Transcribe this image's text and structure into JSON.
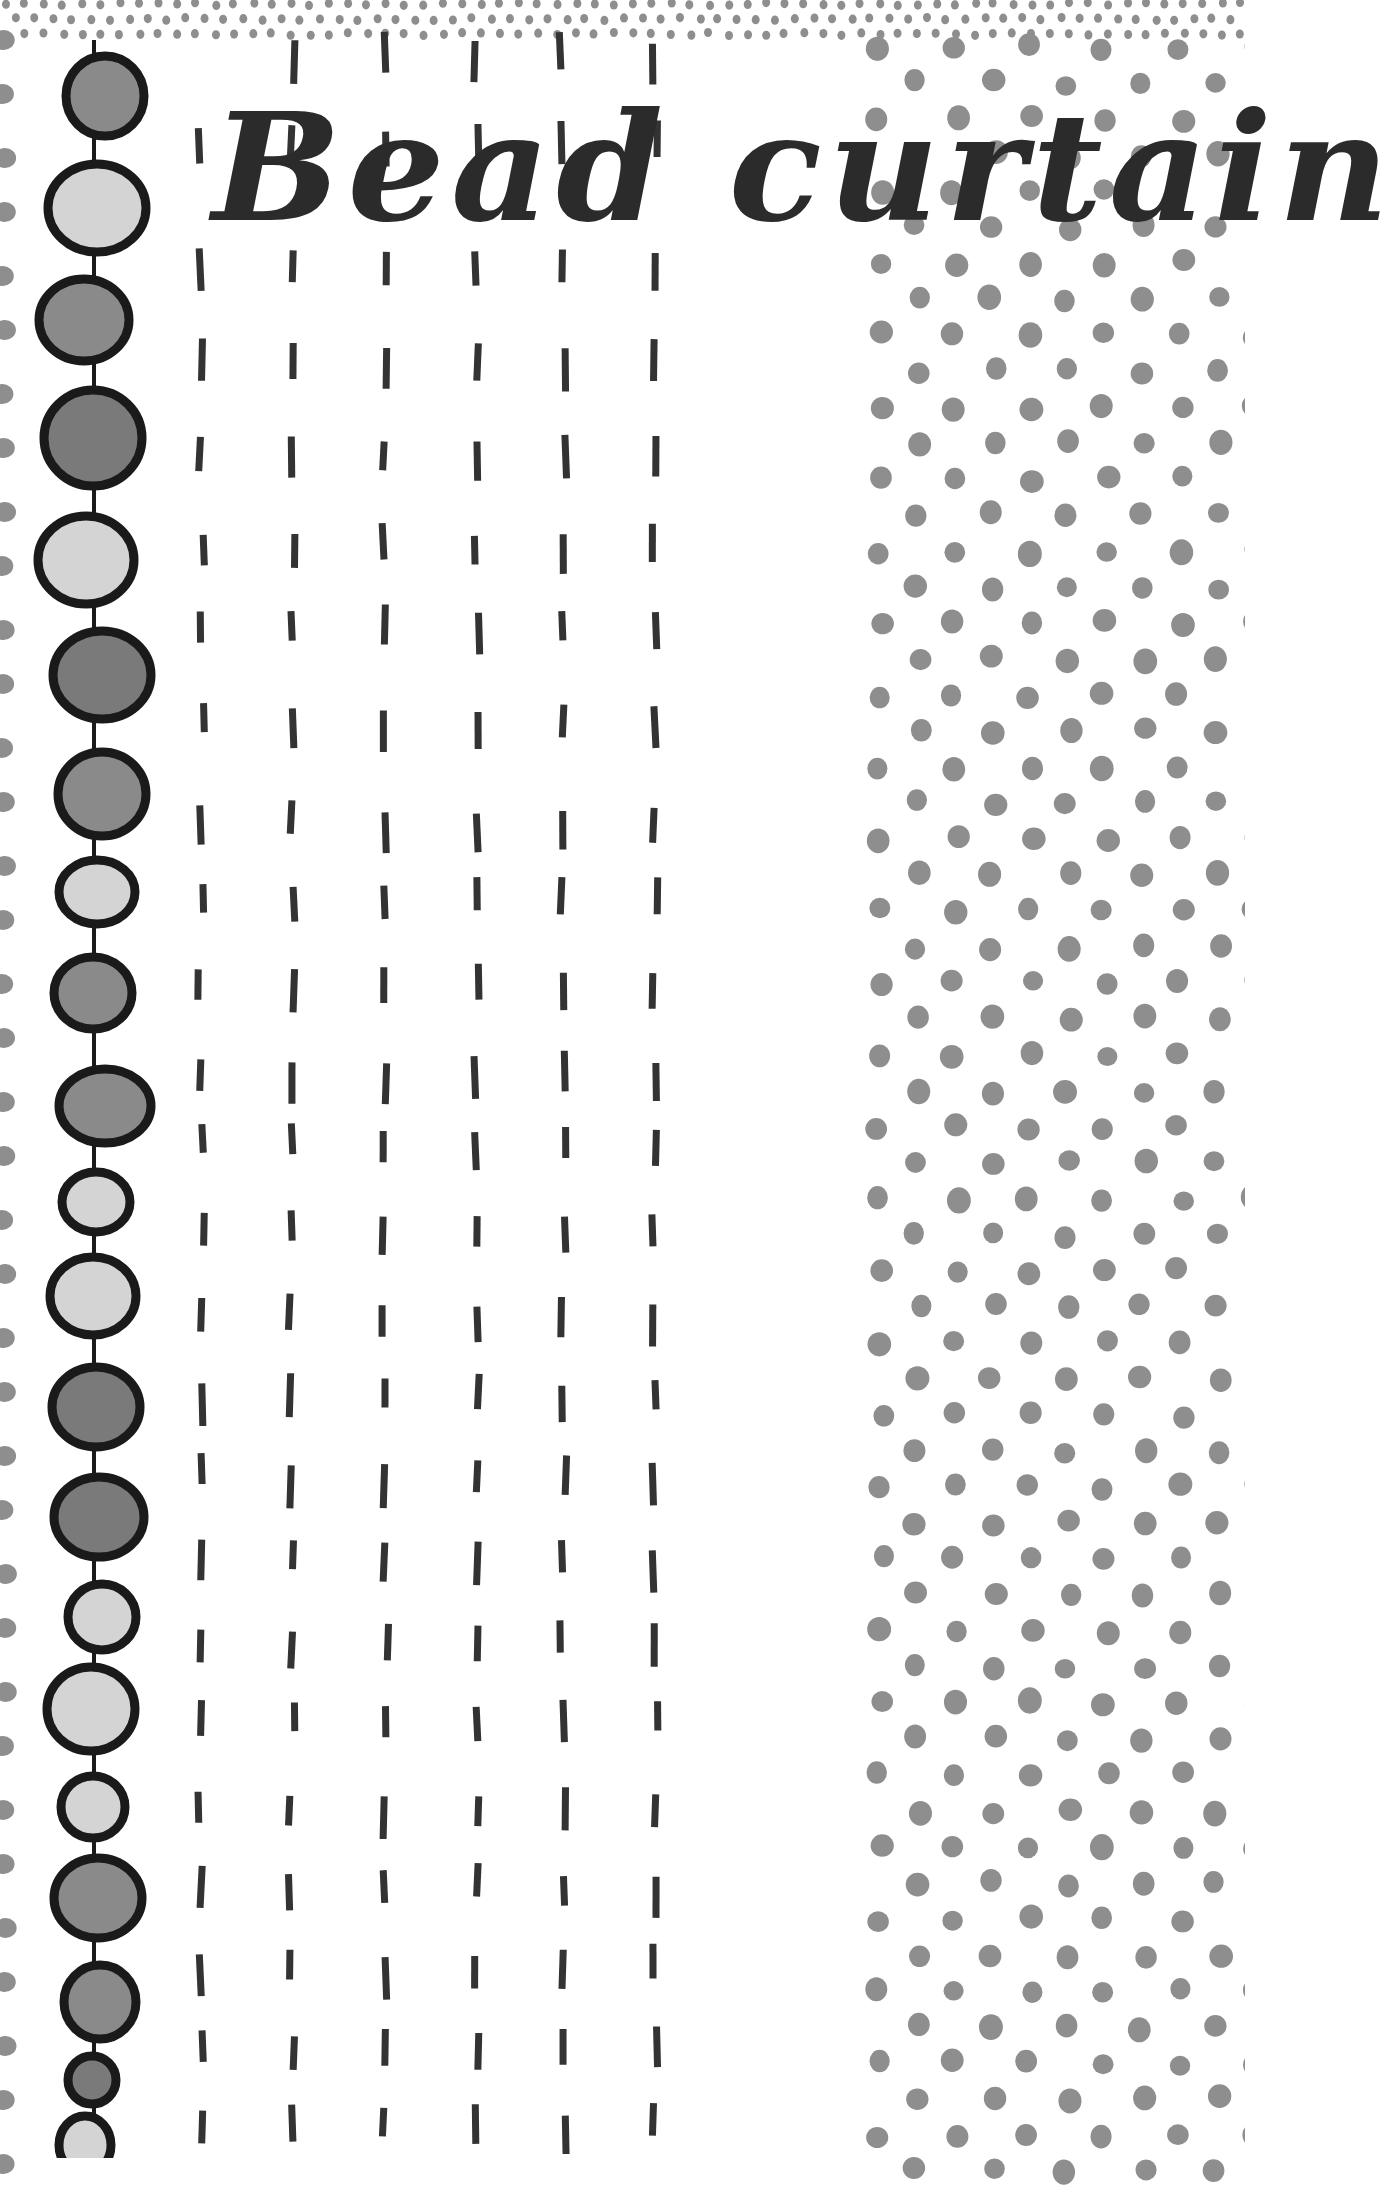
{
  "title": "Bead curtain",
  "colors": {
    "background": "#ffffff",
    "ink": "#2b2b2b",
    "dash": "#333333",
    "dot": "#8e8e8e",
    "bead_outline": "#1a1a1a",
    "bead_light": "#d4d4d4",
    "bead_mid": "#8a8a8a",
    "bead_dark": "#7a7a7a",
    "string": "#1a1a1a"
  },
  "bead_string": {
    "x": 94,
    "beads": [
      {
        "cx": 105,
        "cy": 96,
        "rx": 43,
        "ry": 44,
        "tone": "mid"
      },
      {
        "cx": 97,
        "cy": 208,
        "rx": 53,
        "ry": 48,
        "tone": "light"
      },
      {
        "cx": 84,
        "cy": 320,
        "rx": 49,
        "ry": 45,
        "tone": "mid"
      },
      {
        "cx": 93,
        "cy": 438,
        "rx": 53,
        "ry": 52,
        "tone": "dark"
      },
      {
        "cx": 86,
        "cy": 560,
        "rx": 52,
        "ry": 48,
        "tone": "light"
      },
      {
        "cx": 102,
        "cy": 675,
        "rx": 53,
        "ry": 48,
        "tone": "dark"
      },
      {
        "cx": 102,
        "cy": 794,
        "rx": 48,
        "ry": 46,
        "tone": "mid"
      },
      {
        "cx": 97,
        "cy": 892,
        "rx": 42,
        "ry": 36,
        "tone": "light"
      },
      {
        "cx": 93,
        "cy": 993,
        "rx": 43,
        "ry": 40,
        "tone": "mid"
      },
      {
        "cx": 105,
        "cy": 1106,
        "rx": 50,
        "ry": 41,
        "tone": "mid"
      },
      {
        "cx": 96,
        "cy": 1202,
        "rx": 38,
        "ry": 34,
        "tone": "light"
      },
      {
        "cx": 93,
        "cy": 1296,
        "rx": 47,
        "ry": 43,
        "tone": "light"
      },
      {
        "cx": 96,
        "cy": 1407,
        "rx": 48,
        "ry": 44,
        "tone": "dark"
      },
      {
        "cx": 99,
        "cy": 1517,
        "rx": 49,
        "ry": 44,
        "tone": "dark"
      },
      {
        "cx": 102,
        "cy": 1617,
        "rx": 38,
        "ry": 37,
        "tone": "light"
      },
      {
        "cx": 91,
        "cy": 1709,
        "rx": 48,
        "ry": 46,
        "tone": "light"
      },
      {
        "cx": 93,
        "cy": 1807,
        "rx": 36,
        "ry": 35,
        "tone": "light"
      },
      {
        "cx": 98,
        "cy": 1898,
        "rx": 48,
        "ry": 44,
        "tone": "mid"
      },
      {
        "cx": 100,
        "cy": 2002,
        "rx": 40,
        "ry": 41,
        "tone": "mid"
      },
      {
        "cx": 92,
        "cy": 2080,
        "rx": 28,
        "ry": 28,
        "tone": "dark"
      },
      {
        "cx": 85,
        "cy": 2145,
        "rx": 30,
        "ry": 33,
        "tone": "light",
        "partial": true
      }
    ]
  },
  "dash_columns": {
    "x": [
      201,
      292,
      385,
      477,
      563,
      655
    ],
    "row_tops": [
      38,
      125,
      250,
      345,
      440,
      530,
      610,
      710,
      807,
      880,
      968,
      1057,
      1127,
      1210,
      1300,
      1380,
      1460,
      1545,
      1625,
      1705,
      1790,
      1870,
      1950,
      2030,
      2110
    ],
    "length": 36,
    "width": 7
  },
  "top_band": {
    "rows_y": [
      4,
      19,
      34
    ],
    "spacing": 19,
    "radius": 4
  },
  "dot_field": {
    "x_start": 868,
    "x_spacing": 75,
    "y_start": 47,
    "y_spacing": 36,
    "radius": 11
  },
  "left_edge_dots": {
    "x": 4,
    "y_start": 40,
    "y_spacing": 59,
    "radius": 11
  }
}
